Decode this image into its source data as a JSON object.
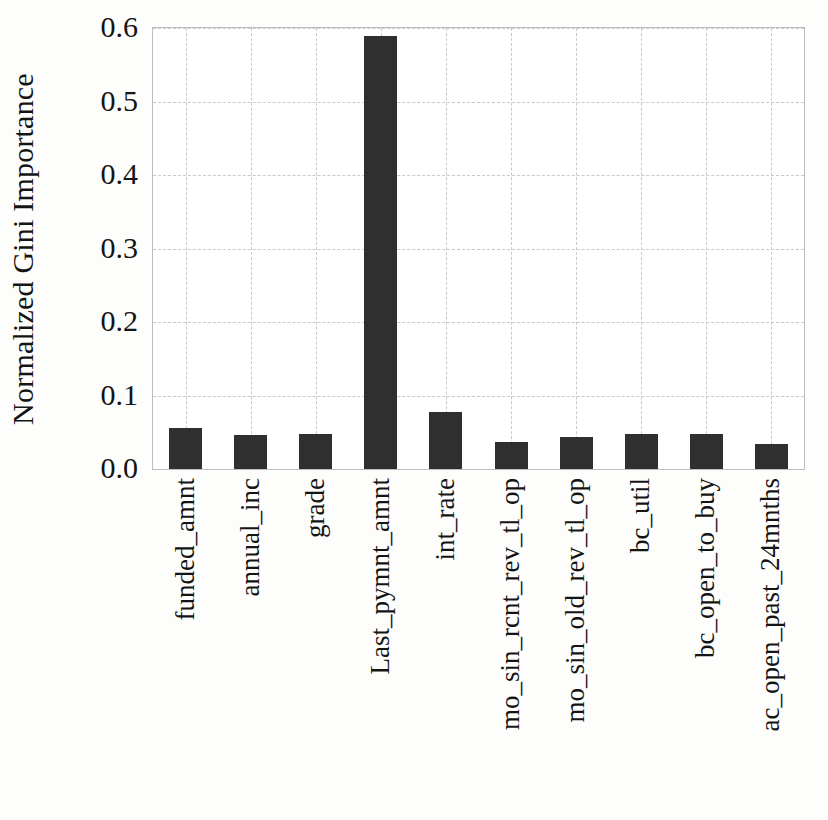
{
  "figure": {
    "background_color": "#fdfdfc",
    "plot_background_color": "#ffffff",
    "bar_color": "#2f2f2f",
    "grid_color": "#c9c9c9",
    "axis_color": "#bdbdbd",
    "caption_remnant": ""
  },
  "chart_data": {
    "type": "bar",
    "title": "",
    "xlabel": "",
    "ylabel": "Normalized Gini Importance",
    "ylim": [
      0.0,
      0.6
    ],
    "yticks": [
      0.0,
      0.1,
      0.2,
      0.3,
      0.4,
      0.5,
      0.6
    ],
    "ytick_labels": [
      "0.0",
      "0.1",
      "0.2",
      "0.3",
      "0.4",
      "0.5",
      "0.6"
    ],
    "grid": true,
    "grid_style": "dashed",
    "legend": null,
    "categories": [
      "funded_amnt",
      "annual_inc",
      "grade",
      "Last_pymnt_amnt",
      "int_rate",
      "mo_sin_rcnt_rev_tl_op",
      "mo_sin_old_rev_tl_op",
      "bc_util",
      "bc_open_to_buy",
      "ac_open_past_24mnths"
    ],
    "values": [
      0.056,
      0.046,
      0.047,
      0.589,
      0.078,
      0.037,
      0.044,
      0.048,
      0.047,
      0.034
    ]
  }
}
